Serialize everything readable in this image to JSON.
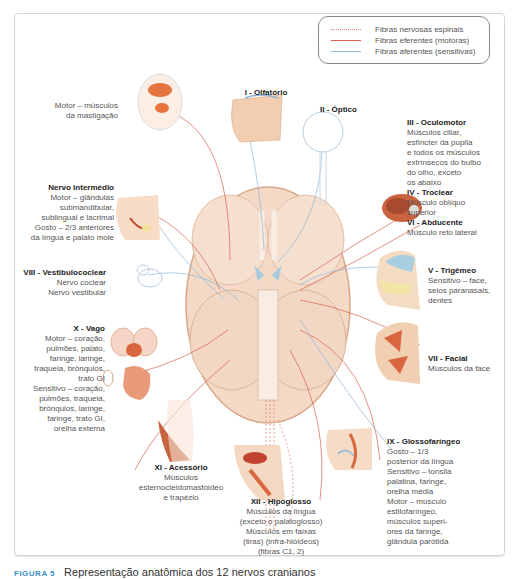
{
  "legend": {
    "items": [
      {
        "label": "Fibras nervosas espinais",
        "style": "dotted",
        "color": "#e58a7a"
      },
      {
        "label": "Fibras eferentes (motoras)",
        "style": "solid",
        "color": "#d9604f"
      },
      {
        "label": "Fibras aferentes (sensitivas)",
        "style": "solid",
        "color": "#8fb6d8"
      }
    ]
  },
  "nerves": {
    "olfatorio": {
      "title": "I - Olfatório"
    },
    "optico": {
      "title": "II - Óptico"
    },
    "oculomotor": {
      "title": "III - Oculomotor",
      "lines": [
        "Músculos ciliar,",
        "esfíncter da pupila",
        "e todos os músculos",
        "extrínsecos do bulbo",
        "do olho, exceto",
        "os abaixo"
      ]
    },
    "troclear": {
      "title": "IV - Troclear",
      "lines": [
        "Músculo oblíquo",
        "superior"
      ]
    },
    "abducente": {
      "title": "VI - Abducente",
      "lines": [
        "Músculo reto lateral"
      ]
    },
    "trigemeo_motor": {
      "lines": [
        "Motor – músculos",
        "da mastigação"
      ]
    },
    "trigemeo": {
      "title": "V - Trigêmeo",
      "lines": [
        "Sensitivo – face,",
        "seios paranasais,",
        "dentes"
      ]
    },
    "intermedio": {
      "title": "Nervo intermédio",
      "lines": [
        "Motor – glândulas",
        "submandibular,",
        "sublingual e lacrimal",
        "Gosto – 2/3 anteriores",
        "da língua e palato mole"
      ]
    },
    "vestibulococlear": {
      "title": "VIII - Vestibulococlear",
      "lines": [
        "Nervo coclear",
        "Nervo vestibular"
      ]
    },
    "facial": {
      "title": "VII - Facial",
      "lines": [
        "Músculos da face"
      ]
    },
    "vago": {
      "title": "X - Vago",
      "lines": [
        "Motor – coração,",
        "pulmões, palato,",
        "faringe, laringe,",
        "traqueia, brônquios,",
        "trato GI",
        "Sensitivo – coração,",
        "pulmões, traqueia,",
        "brônquios, laringe,",
        "faringe, trato GI,",
        "orelha externa"
      ]
    },
    "glossofaringeo": {
      "title": "IX - Glossofaríngeo",
      "lines": [
        "Gosto – 1/3",
        "posterior da língua",
        "Sensitivo – tonsila",
        "palatina, faringe,",
        "orelha média",
        "Motor – músculo",
        "estilofaríngeo,",
        "músculos superi-",
        "ores da faringe,",
        "glândula parótida"
      ]
    },
    "acessorio": {
      "title": "XI - Acessório",
      "lines": [
        "Músculos",
        "esternocleidomastóideo",
        "e trapézio"
      ]
    },
    "hipoglosso": {
      "title": "XII - Hipoglosso",
      "lines": [
        "Músculos da língua",
        "(exceto o palatoglosso)",
        "Músculos em faixas",
        "(tiras) (infra-hióideos)",
        "(fibras C1, 2)"
      ]
    }
  },
  "caption": {
    "figure": "FIGURA 5",
    "text": "Representação anatômica dos 12 nervos cranianos"
  },
  "colors": {
    "motor": "#d9604f",
    "sensory": "#8fb6d8",
    "spinal": "#e58a7a",
    "brain": "#f1d2bd",
    "brain_outline": "#d8a786",
    "muscle": "#d9663f"
  }
}
